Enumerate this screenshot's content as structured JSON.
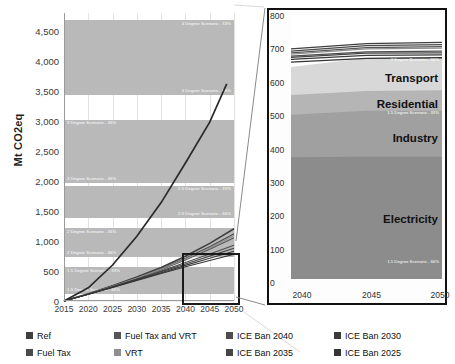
{
  "chart_data": {
    "type": "line",
    "title": "",
    "ylabel": "Mt CO2eq",
    "xlabel": "",
    "xlim": [
      2015,
      2050
    ],
    "ylim": [
      0,
      4500
    ],
    "x": [
      2015,
      2020,
      2025,
      2030,
      2035,
      2040,
      2045,
      2050
    ],
    "yticks": [
      "0",
      "500",
      "1,000",
      "1,500",
      "2,000",
      "2,500",
      "3,000",
      "3,500",
      "4,000",
      "4,500"
    ],
    "ytick_values": [
      0,
      500,
      1000,
      1500,
      2000,
      2500,
      3000,
      3500,
      4000,
      4500
    ],
    "xticks": [
      "2015",
      "2020",
      "2025",
      "2030",
      "2035",
      "2040",
      "2045",
      "2050"
    ],
    "grid": true,
    "legend_position": "bottom",
    "series": [
      {
        "name": "Ref",
        "values": [
          0,
          120,
          255,
          400,
          560,
          745,
          960,
          1205
        ]
      },
      {
        "name": "Fuel Tax",
        "values": [
          0,
          118,
          248,
          388,
          540,
          712,
          905,
          1120
        ]
      },
      {
        "name": "Fuel Tax and VRT",
        "values": [
          0,
          116,
          243,
          378,
          522,
          684,
          862,
          1056
        ]
      },
      {
        "name": "VRT",
        "values": [
          0,
          117,
          246,
          383,
          531,
          698,
          884,
          1090
        ]
      },
      {
        "name": "ICE Ban 2040",
        "values": [
          0,
          115,
          238,
          366,
          498,
          640,
          784,
          930
        ]
      },
      {
        "name": "ICE Ban 2035",
        "values": [
          0,
          114,
          235,
          360,
          486,
          618,
          748,
          880
        ]
      },
      {
        "name": "ICE Ban 2030",
        "values": [
          0,
          113,
          231,
          352,
          472,
          594,
          712,
          828
        ]
      },
      {
        "name": "ICE Ban 2025",
        "values": [
          0,
          112,
          227,
          344,
          458,
          570,
          676,
          778
        ]
      }
    ],
    "budget_bands": [
      {
        "label_top": "4 Degree Scenario - 33%",
        "label_bottom": "4 Degree Scenario - 66%",
        "top": 4680,
        "bottom": 3430
      },
      {
        "label_top": "3 Degree Scenario - 33%",
        "label_bottom": "3 Degree Scenario - 66%",
        "top": 3020,
        "bottom": 1970
      },
      {
        "label_top": "2.5 Degree Scenario - 33%",
        "label_bottom": "2.5 Degree Scenario - 66%",
        "top": 1920,
        "bottom": 1380
      },
      {
        "label_top": "2 Degree Scenario - 33%",
        "label_bottom": "2 Degree Scenario - 66%",
        "top": 1215,
        "bottom": 735
      },
      {
        "label_top": "1.5 Degree Scenario - 33%",
        "label_bottom": "1.5 Degree Scenario - 66%",
        "top": 560,
        "bottom": 120
      }
    ]
  },
  "inset_chart": {
    "type": "area",
    "ylim": [
      0,
      800
    ],
    "xlim": [
      2040,
      2050
    ],
    "yticks": [
      "0",
      "100",
      "200",
      "300",
      "400",
      "500",
      "600",
      "700",
      "800"
    ],
    "ytick_values": [
      0,
      100,
      200,
      300,
      400,
      500,
      600,
      700,
      800
    ],
    "xticks": [
      "2040",
      "2045",
      "2050"
    ],
    "xtick_values": [
      2040,
      2045,
      2050
    ],
    "sector_labels": [
      "Transport",
      "Residential",
      "Industry",
      "Electricity"
    ],
    "sectors": [
      {
        "name": "Electricity",
        "values": [
          370,
          372,
          372
        ]
      },
      {
        "name": "Industry",
        "values": [
          500,
          512,
          512
        ]
      },
      {
        "name": "Residential",
        "values": [
          560,
          572,
          574
        ]
      },
      {
        "name": "Transport",
        "values": [
          645,
          672,
          676
        ]
      }
    ],
    "band_labels": [
      {
        "text": "2 Degree Scenario - 66%",
        "value": 665
      },
      {
        "text": "1.5 Degree Scenario - 33%",
        "value": 505
      },
      {
        "text": "1.5 Degree Scenario - 66%",
        "value": 60
      }
    ],
    "scenario_lines": [
      {
        "name": "Ref",
        "values": [
          700,
          716,
          720
        ]
      },
      {
        "name": "Fuel Tax",
        "values": [
          693,
          710,
          713
        ]
      },
      {
        "name": "Fuel Tax and VRT",
        "values": [
          688,
          704,
          707
        ]
      },
      {
        "name": "VRT",
        "values": [
          684,
          700,
          702
        ]
      },
      {
        "name": "ICE Ban 2040",
        "values": [
          678,
          691,
          693
        ]
      },
      {
        "name": "ICE Ban 2035",
        "values": [
          674,
          687,
          688
        ]
      },
      {
        "name": "ICE Ban 2030",
        "values": [
          668,
          680,
          682
        ]
      },
      {
        "name": "ICE Ban 2025",
        "values": [
          660,
          671,
          673
        ]
      }
    ]
  },
  "legend": {
    "items": [
      {
        "label": "Ref",
        "color": "#3f3f3f"
      },
      {
        "label": "Fuel Tax",
        "color": "#4a4a4a"
      },
      {
        "label": "Fuel Tax and VRT",
        "color": "#555555"
      },
      {
        "label": "VRT",
        "color": "#8e8e8e"
      },
      {
        "label": "ICE Ban 2040",
        "color": "#4d4d4d"
      },
      {
        "label": "ICE Ban 2035",
        "color": "#454545"
      },
      {
        "label": "ICE Ban 2030",
        "color": "#3a3a3a"
      },
      {
        "label": "ICE Ban 2025",
        "color": "#343434"
      }
    ]
  },
  "colors": {
    "band_fill": "#b9b9b9",
    "grid": "#e4e4e4",
    "axis": "#9a9a9a",
    "inset_border": "#111111",
    "transport": "#d8d8d8",
    "residential": "#b5b5b5",
    "industry": "#a0a0a0",
    "electricity": "#8c8c8c"
  }
}
